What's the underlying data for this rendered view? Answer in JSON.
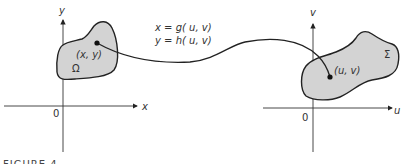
{
  "figure": {
    "caption": "FIGURE 4",
    "colors": {
      "region_fill": "#d3d3d3",
      "stroke": "#222222"
    },
    "left_plane": {
      "x_axis_label": "x",
      "y_axis_label": "y",
      "origin_label": "0",
      "region_label": "Ω",
      "point_label": "(x, y)"
    },
    "right_plane": {
      "u_axis_label": "u",
      "v_axis_label": "v",
      "origin_label": "0",
      "region_label": "Σ",
      "point_label": "(u, v)"
    },
    "mapping": {
      "line1": "x = g( u, v)",
      "line2": "y = h( u, v)"
    }
  }
}
